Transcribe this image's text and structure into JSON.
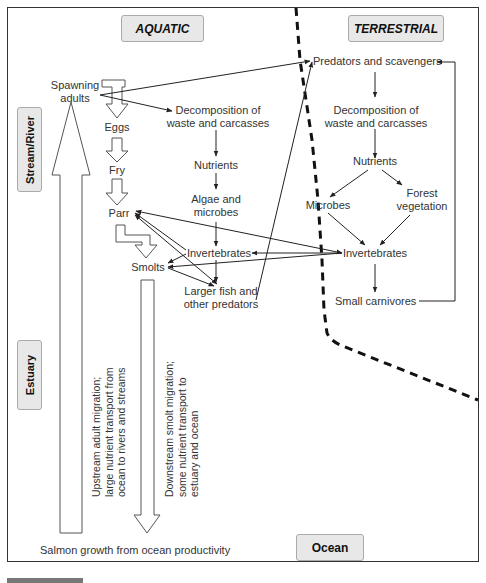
{
  "headers": {
    "aquatic": "AQUATIC",
    "terrestrial": "TERRESTRIAL",
    "ocean": "Ocean"
  },
  "zones": {
    "stream_river": "Stream/River",
    "estuary": "Estuary"
  },
  "aquatic_nodes": {
    "spawning_adults_1": "Spawning",
    "spawning_adults_2": "adults",
    "eggs": "Eggs",
    "fry": "Fry",
    "parr": "Parr",
    "smolts": "Smolts",
    "decomp_1": "Decomposition of",
    "decomp_2": "waste and carcasses",
    "nutrients": "Nutrients",
    "algae_1": "Algae and",
    "algae_2": "microbes",
    "invertebrates": "Invertebrates",
    "larger_fish_1": "Larger fish and",
    "larger_fish_2": "other predators"
  },
  "terrestrial_nodes": {
    "predators": "Predators and scavengers",
    "decomp_1": "Decomposition of",
    "decomp_2": "waste and carcasses",
    "nutrients": "Nutrients",
    "microbes": "Microbes",
    "forest_1": "Forest",
    "forest_2": "vegetation",
    "invertebrates": "Invertebrates",
    "small_carnivores": "Small carnivores"
  },
  "migration": {
    "upstream_1": "Upstream adult migration;",
    "upstream_2": "large nutrient transport from",
    "upstream_3": "ocean to rivers and streams",
    "downstream_1": "Downstream smolt migration;",
    "downstream_2": "some nutrient transport to",
    "downstream_3": "estuary and ocean"
  },
  "footer": {
    "salmon_growth": "Salmon growth from ocean productivity"
  },
  "colors": {
    "header_bg": "#e8e8e8",
    "line": "#222222",
    "text": "#333333"
  }
}
